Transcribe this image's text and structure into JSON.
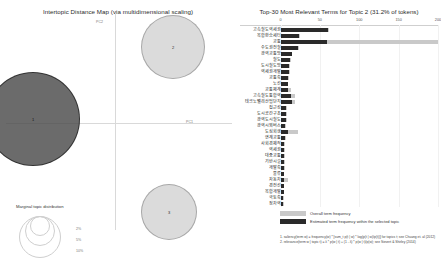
{
  "left": {
    "title": "Intertopic Distance Map (via multidimensional scaling)",
    "pc1_label": "PC1",
    "pc2_label": "PC2",
    "marginal_legend_title": "Marginal topic distribution",
    "marginal_sizes": [
      "2%",
      "5%",
      "10%"
    ],
    "topics": [
      {
        "id": "1",
        "x": 32,
        "y": 118,
        "r": 46,
        "selected": true
      },
      {
        "id": "2",
        "x": 172,
        "y": 46,
        "r": 31,
        "selected": false
      },
      {
        "id": "3",
        "x": 168,
        "y": 211,
        "r": 27,
        "selected": false
      }
    ]
  },
  "right": {
    "title": "Top-30 Most Relevant Terms for Topic 2 (31.2% of tokens)",
    "axis_ticks": [
      "0",
      "50",
      "100",
      "150",
      "200"
    ],
    "axis_max": 200,
    "legend": {
      "overall_label": "Overall term frequency",
      "topic_label": "Estimated term frequency within the selected topic",
      "footnote1": "1. saliency(term w) = frequency(w) * [sum_t p(t | w) * log(p(t | w)/p(t))] for topics t; see Chuang et. al (2012)",
      "footnote2": "2. relevance(term w | topic t) = λ * p(w | t) + (1 - λ) * p(w | t)/p(w); see Sievert & Shirley (2014)"
    }
  },
  "chart_data": {
    "type": "bar",
    "title": "Top-30 Most Relevant Terms for Topic 2 (31.2% of tokens)",
    "xlabel": "",
    "ylabel": "",
    "xlim": [
      0,
      200
    ],
    "grid": false,
    "legend_position": "bottom",
    "orientation": "horizontal",
    "categories": [
      "고속철도역세권",
      "복합환승세터",
      "교통",
      "수도권전철",
      "광역교통망",
      "철도",
      "도시철도망",
      "역세권개발",
      "교통축",
      "노선",
      "교통체계",
      "고속철도통합역",
      "테크노밸리산업단지",
      "접근성",
      "도시공간구조",
      "광역도시철도",
      "광역시외버스",
      "도심회생",
      "연계교통",
      "사회경제적",
      "역세권",
      "대중교통",
      "기반시설",
      "개발축",
      "물류",
      "자동차",
      "경전선",
      "복합개발",
      "국토축",
      "정차역"
    ],
    "series": [
      {
        "name": "Overall term frequency",
        "values": [
          62,
          25,
          200,
          23,
          15,
          13,
          12,
          12,
          11,
          10,
          13,
          18,
          19,
          8,
          8,
          8,
          7,
          22,
          7,
          6,
          6,
          6,
          6,
          6,
          5,
          9,
          5,
          5,
          4,
          4
        ]
      },
      {
        "name": "Estimated term frequency within the selected topic",
        "values": [
          60,
          24,
          59,
          22,
          14,
          12,
          11,
          11,
          10,
          9,
          9,
          13,
          14,
          7,
          7,
          7,
          6,
          9,
          6,
          5,
          5,
          5,
          5,
          5,
          4,
          5,
          4,
          4,
          3,
          3
        ]
      }
    ]
  }
}
